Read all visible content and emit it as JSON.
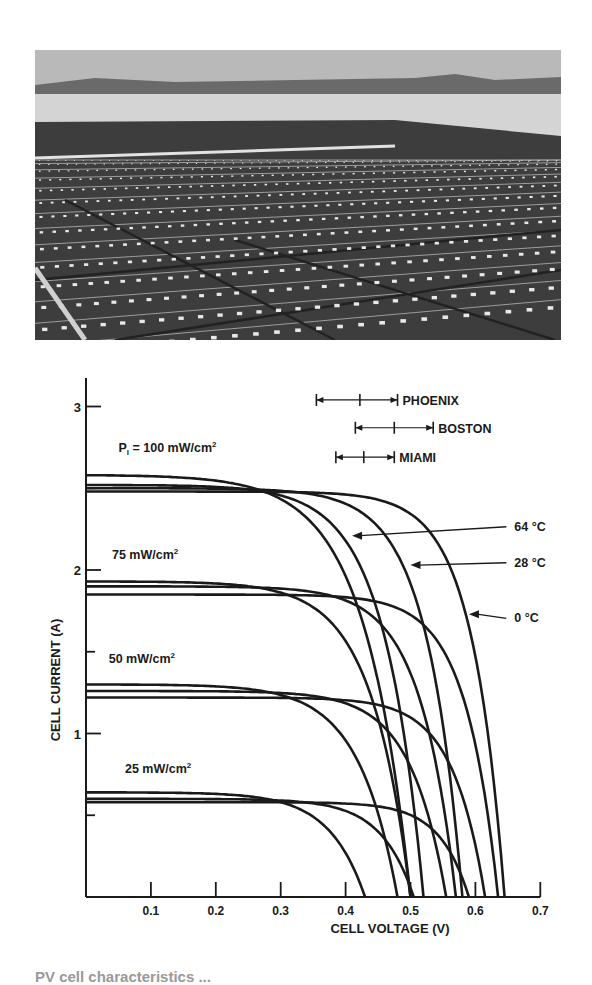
{
  "photo": {
    "description": "Rooftop array of photovoltaic panels (grayscale photograph)",
    "colors": {
      "sky": "#b8b8b8",
      "horizon": "#6e6e6e",
      "roof": "#d8d8d8",
      "panel": "#3f3f3f",
      "cell_gap": "#e6e6e6"
    }
  },
  "chart_data": {
    "type": "line",
    "title": "",
    "xlabel": "CELL VOLTAGE (V)",
    "ylabel": "CELL CURRENT (A)",
    "xlim": [
      0,
      0.7
    ],
    "ylim": [
      0,
      3.2
    ],
    "x_ticks": [
      "0.1",
      "0.2",
      "0.3",
      "0.4",
      "0.5",
      "0.6",
      "0.7"
    ],
    "y_ticks": [
      "1",
      "2",
      "3"
    ],
    "y_minor_ticks": [
      0.5,
      1.5,
      2.5
    ],
    "grid": false,
    "irradiance_labels": [
      {
        "text": "P",
        "sub": "l",
        "rest": " = 100 mW/cm",
        "sup": "2",
        "V": 0.05,
        "I": 2.72
      },
      {
        "text": "75 mW/cm",
        "sup": "2",
        "V": 0.04,
        "I": 2.07
      },
      {
        "text": "50 mW/cm",
        "sup": "2",
        "V": 0.035,
        "I": 1.43
      },
      {
        "text": "25 mW/cm",
        "sup": "2",
        "V": 0.06,
        "I": 0.76
      }
    ],
    "temperature_labels": [
      {
        "text": "64 °C",
        "V": 0.66,
        "I": 2.24,
        "arrow_to_V": 0.41,
        "arrow_to_I": 2.21
      },
      {
        "text": "28 °C",
        "V": 0.66,
        "I": 2.02,
        "arrow_to_V": 0.5,
        "arrow_to_I": 2.03
      },
      {
        "text": "0 °C",
        "V": 0.66,
        "I": 1.68,
        "arrow_to_V": 0.59,
        "arrow_to_I": 1.73
      }
    ],
    "location_ranges": [
      {
        "name": "PHOENIX",
        "min": 0.355,
        "mid": 0.422,
        "max": 0.48,
        "I": 3.04
      },
      {
        "name": "BOSTON",
        "min": 0.415,
        "mid": 0.475,
        "max": 0.535,
        "I": 2.87
      },
      {
        "name": "MIAMI",
        "min": 0.385,
        "mid": 0.428,
        "max": 0.475,
        "I": 2.69
      }
    ],
    "series": [
      {
        "name": "100 mW/cm2, 64 °C",
        "irradiance": 100,
        "temp_C": 64,
        "Isc": 2.52,
        "Voc": 0.52,
        "knee": 0.06
      },
      {
        "name": "100 mW/cm2, 28 °C",
        "irradiance": 100,
        "temp_C": 28,
        "Isc": 2.5,
        "Voc": 0.58,
        "knee": 0.055
      },
      {
        "name": "100 mW/cm2, 0 °C",
        "irradiance": 100,
        "temp_C": 0,
        "Isc": 2.48,
        "Voc": 0.645,
        "knee": 0.05
      },
      {
        "name": "100 mW/cm2, ref",
        "irradiance": 100,
        "temp_C": null,
        "Isc": 2.58,
        "Voc": 0.5,
        "knee": 0.07
      },
      {
        "name": "75 mW/cm2, 64 °C",
        "irradiance": 75,
        "temp_C": 64,
        "Isc": 1.93,
        "Voc": 0.5,
        "knee": 0.06
      },
      {
        "name": "75 mW/cm2, 28 °C",
        "irradiance": 75,
        "temp_C": 28,
        "Isc": 1.9,
        "Voc": 0.57,
        "knee": 0.055
      },
      {
        "name": "75 mW/cm2, 0 °C",
        "irradiance": 75,
        "temp_C": 0,
        "Isc": 1.85,
        "Voc": 0.635,
        "knee": 0.05
      },
      {
        "name": "50 mW/cm2, 64 °C",
        "irradiance": 50,
        "temp_C": 64,
        "Isc": 1.3,
        "Voc": 0.48,
        "knee": 0.06
      },
      {
        "name": "50 mW/cm2, 28 °C",
        "irradiance": 50,
        "temp_C": 28,
        "Isc": 1.26,
        "Voc": 0.555,
        "knee": 0.055
      },
      {
        "name": "50 mW/cm2, 0 °C",
        "irradiance": 50,
        "temp_C": 0,
        "Isc": 1.22,
        "Voc": 0.615,
        "knee": 0.05
      },
      {
        "name": "25 mW/cm2, 64 °C",
        "irradiance": 25,
        "temp_C": 64,
        "Isc": 0.64,
        "Voc": 0.43,
        "knee": 0.055
      },
      {
        "name": "25 mW/cm2, 28 °C",
        "irradiance": 25,
        "temp_C": 28,
        "Isc": 0.6,
        "Voc": 0.505,
        "knee": 0.05
      },
      {
        "name": "25 mW/cm2, 0 °C",
        "irradiance": 25,
        "temp_C": 0,
        "Isc": 0.58,
        "Voc": 0.59,
        "knee": 0.045
      }
    ]
  },
  "caption": {
    "text": "PV cell characteristics ..."
  }
}
